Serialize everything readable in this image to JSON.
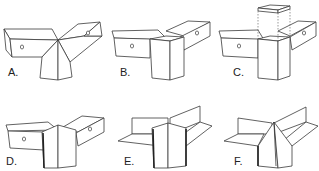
{
  "figure": {
    "panels": [
      {
        "id": "A",
        "label": "A.",
        "description": "Two square tubes meeting at a corner with a mitered vertical leg"
      },
      {
        "id": "B",
        "label": "B.",
        "description": "Two square tubes butted into a square vertical post"
      },
      {
        "id": "C",
        "label": "C.",
        "description": "Square post with separate cap shown exploded above (dashed guides)"
      },
      {
        "id": "D",
        "label": "D.",
        "description": "Two square tubes joined by a flat vertical cross plate"
      },
      {
        "id": "E",
        "label": "E.",
        "description": "Open flange cross joint with vertical center plates"
      },
      {
        "id": "F",
        "label": "F.",
        "description": "Open flange joint with mitered vertical plates"
      }
    ],
    "colors": {
      "line": "#3a3a3a",
      "background": "#ffffff"
    }
  }
}
